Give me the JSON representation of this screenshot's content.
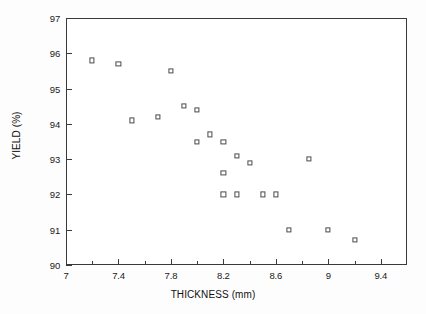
{
  "chart_data": {
    "type": "scatter",
    "title": "",
    "xlabel": "THICKNESS (mm)",
    "ylabel": "YIELD (%)",
    "xlim": [
      7.0,
      9.6
    ],
    "ylim": [
      90,
      97
    ],
    "grid": false,
    "legend": null,
    "marker": "open-square",
    "x_major_ticks": [
      7,
      7.4,
      7.8,
      8.2,
      8.6,
      9,
      9.4
    ],
    "x_major_tick_labels": [
      "7",
      "7.4",
      "7.8",
      "8.2",
      "8.6",
      "9",
      "9.4"
    ],
    "x_minor_ticks": [
      7.2,
      7.6,
      8.0,
      8.4,
      8.8,
      9.2
    ],
    "y_major_ticks": [
      90,
      91,
      92,
      93,
      94,
      95,
      96,
      97
    ],
    "y_major_tick_labels": [
      "90",
      "91",
      "92",
      "93",
      "94",
      "95",
      "96",
      "97"
    ],
    "series": [
      {
        "name": "yield vs thickness",
        "points": [
          {
            "x": 7.2,
            "y": 95.8
          },
          {
            "x": 7.4,
            "y": 95.7
          },
          {
            "x": 7.5,
            "y": 94.1
          },
          {
            "x": 7.7,
            "y": 94.2
          },
          {
            "x": 7.8,
            "y": 95.5
          },
          {
            "x": 7.9,
            "y": 94.5
          },
          {
            "x": 8.0,
            "y": 94.4
          },
          {
            "x": 8.0,
            "y": 93.5
          },
          {
            "x": 8.1,
            "y": 93.7
          },
          {
            "x": 8.2,
            "y": 93.5
          },
          {
            "x": 8.2,
            "y": 92.6
          },
          {
            "x": 8.2,
            "y": 92.0
          },
          {
            "x": 8.3,
            "y": 93.1
          },
          {
            "x": 8.3,
            "y": 92.0
          },
          {
            "x": 8.4,
            "y": 92.9
          },
          {
            "x": 8.5,
            "y": 92.0
          },
          {
            "x": 8.6,
            "y": 92.0
          },
          {
            "x": 8.7,
            "y": 91.0
          },
          {
            "x": 8.85,
            "y": 93.0
          },
          {
            "x": 9.0,
            "y": 91.0
          },
          {
            "x": 9.2,
            "y": 90.7
          }
        ]
      }
    ],
    "colors": {
      "axis": "#3a3a3a",
      "marker_edge": "#4a4a4a",
      "marker_fill": "#ffffff",
      "background": "#ffffff",
      "text": "#111111"
    }
  }
}
